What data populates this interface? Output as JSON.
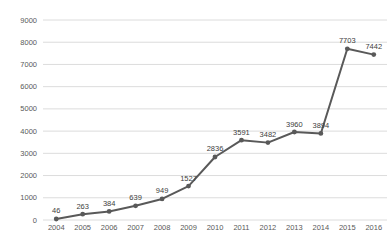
{
  "chart_data": {
    "type": "line",
    "title": "",
    "xlabel": "",
    "ylabel": "",
    "categories": [
      "2004",
      "2005",
      "2006",
      "2007",
      "2008",
      "2009",
      "2010",
      "2011",
      "2012",
      "2013",
      "2014",
      "2015",
      "2016"
    ],
    "values": [
      46,
      263,
      384,
      639,
      949,
      1527,
      2836,
      3591,
      3482,
      3960,
      3894,
      7703,
      7442
    ],
    "data_labels": [
      "46",
      "263",
      "384",
      "639",
      "949",
      "1527",
      "2836",
      "3591",
      "3482",
      "3960",
      "3894",
      "7703",
      "7442"
    ],
    "ylim": [
      0,
      9000
    ],
    "ytick_step": 1000,
    "ytick_labels": [
      "0",
      "1000",
      "2000",
      "3000",
      "4000",
      "5000",
      "6000",
      "7000",
      "8000",
      "9000"
    ],
    "grid": true,
    "legend": "none",
    "colors": {
      "background": "#ffffff",
      "line": "#595959",
      "marker": "#595959",
      "gridline": "#dcdcdc",
      "axis_tick_text": "#595959",
      "data_label_text": "#404040"
    }
  }
}
